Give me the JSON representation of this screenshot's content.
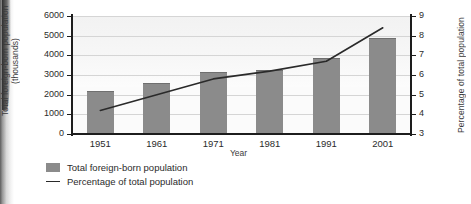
{
  "chart_data": {
    "type": "bar",
    "title": "",
    "subtitle": "",
    "xlabel": "Year",
    "ylabel": "Total foreign-born population (thousands)",
    "ylabel_right": "Percentage of total population",
    "categories": [
      "1951",
      "1961",
      "1971",
      "1981",
      "1991",
      "2001"
    ],
    "grid": true,
    "legend_position": "bottom-left",
    "ylim": [
      0,
      6000
    ],
    "yticks": [
      0,
      1000,
      2000,
      3000,
      4000,
      5000,
      6000
    ],
    "ylim_right": [
      3,
      9
    ],
    "yticks_right": [
      3,
      4,
      5,
      6,
      7,
      8,
      9
    ],
    "series": [
      {
        "name": "Total foreign-born population",
        "type": "bar",
        "axis": "left",
        "units": "thousands",
        "color": "#8b8b8b",
        "values": [
          2120,
          2570,
          3100,
          3200,
          3800,
          4850
        ]
      },
      {
        "name": "Percentage of total population",
        "type": "line",
        "axis": "right",
        "units": "percent",
        "color": "#2a2a2a",
        "values": [
          4.2,
          5.0,
          5.8,
          6.2,
          6.7,
          8.4
        ]
      }
    ]
  },
  "legend": {
    "items": [
      {
        "label": "Total foreign-born population",
        "marker": "square"
      },
      {
        "label": "Percentage of total population",
        "marker": "line"
      }
    ]
  },
  "axes": {
    "left_title": "Total foreign-born population (thousands)",
    "right_title": "Percentage of total population",
    "x_title": "Year"
  }
}
